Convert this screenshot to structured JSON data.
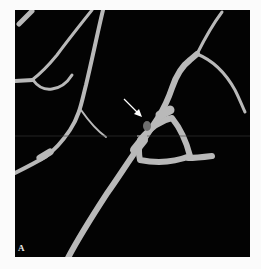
{
  "figure": {
    "panel_label": "A",
    "annotation": "arrow",
    "colors": {
      "background": "#fbfbfb",
      "panel": "#030303",
      "vessel": "#b9b9b9",
      "lesion": "#6e6e6e",
      "arrow": "#ffffff"
    }
  }
}
